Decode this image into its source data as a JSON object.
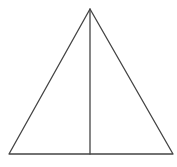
{
  "diagram": {
    "type": "geometry",
    "stroke_color": "#444444",
    "background": "#ffffff",
    "shapes": {
      "triangle": {
        "apex": [
          90,
          9
        ],
        "base_left": [
          9,
          154
        ],
        "base_right": [
          173,
          154
        ]
      },
      "altitude": {
        "from": [
          90,
          9
        ],
        "to": [
          90,
          154
        ]
      }
    },
    "labels": []
  }
}
